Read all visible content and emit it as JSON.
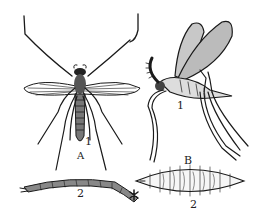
{
  "figure": {
    "panels": [
      {
        "id": "A",
        "label": "A",
        "parts": [
          {
            "num": "1",
            "name": "adult"
          },
          {
            "num": "2",
            "name": "larva"
          }
        ]
      },
      {
        "id": "B",
        "label": "B",
        "parts": [
          {
            "num": "1",
            "name": "adult"
          },
          {
            "num": "2",
            "name": "larva"
          }
        ]
      }
    ],
    "labels": {
      "panel_a": "A",
      "panel_b": "B",
      "a_adult": "1",
      "a_larva": "2",
      "b_adult": "1",
      "b_larva": "2"
    },
    "colors": {
      "ink": "#1a1a1a",
      "background": "#ffffff",
      "wing_shade": "#b8b8b8"
    }
  }
}
